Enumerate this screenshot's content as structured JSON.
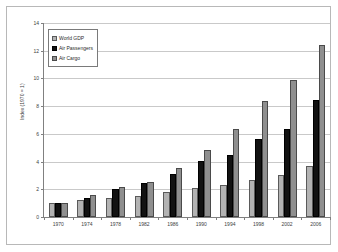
{
  "chart_data": {
    "type": "bar",
    "title": "",
    "subtitle": "",
    "xlabel": "",
    "ylabel": "Index (1970 = 1)",
    "ylim": [
      0,
      14
    ],
    "yticks": [
      0,
      2,
      4,
      6,
      8,
      10,
      12,
      14
    ],
    "ytick_labels": [
      "0",
      "2",
      "4",
      "6",
      "8",
      "10",
      "12",
      "14"
    ],
    "grid": "horizontal",
    "legend_position": "top-left",
    "categories": [
      "1970",
      "1974",
      "1978",
      "1982",
      "1986",
      "1990",
      "1994",
      "1998",
      "2002",
      "2006"
    ],
    "series": [
      {
        "name": "World GDP",
        "color": "#b3b3b3",
        "values": [
          1.0,
          1.2,
          1.4,
          1.55,
          1.8,
          2.1,
          2.3,
          2.65,
          3.05,
          3.65
        ]
      },
      {
        "name": "Air Passengers",
        "color": "#121212",
        "values": [
          1.0,
          1.4,
          2.0,
          2.45,
          3.1,
          4.05,
          4.5,
          5.65,
          6.35,
          8.45
        ]
      },
      {
        "name": "Air Cargo",
        "color": "#8f8f8f",
        "values": [
          1.0,
          1.6,
          2.15,
          2.55,
          3.55,
          4.85,
          6.35,
          8.4,
          9.9,
          12.4
        ]
      }
    ]
  },
  "legend": {
    "items": [
      {
        "label": "World GDP",
        "swatch": "gdp"
      },
      {
        "label": "Air Passengers",
        "swatch": "pax"
      },
      {
        "label": "Air Cargo",
        "swatch": "cargo"
      }
    ]
  }
}
